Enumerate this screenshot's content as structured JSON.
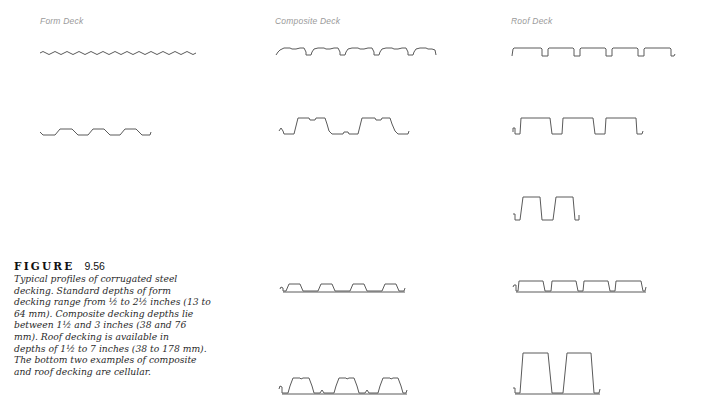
{
  "columns": [
    {
      "id": "form",
      "label": "Form Deck"
    },
    {
      "id": "composite",
      "label": "Composite Deck"
    },
    {
      "id": "roof",
      "label": "Roof Deck"
    }
  ],
  "figure": {
    "word": "FIGURE",
    "number": "9.56",
    "caption_lines": [
      "Typical profiles of corrugated steel",
      "decking. Standard depths of form",
      "decking range from ½ to 2½ inches (13 to",
      "64 mm). Composite decking depths lie",
      "between 1½ and 3 inches (38 and 76",
      "mm). Roof decking is available in",
      "depths of 1½ to 7 inches (38 to 178 mm).",
      "The bottom two examples of composite",
      "and roof decking are cellular."
    ]
  },
  "profiles": [
    {
      "column": "form",
      "name": "form-deck-corrugated-wave"
    },
    {
      "column": "form",
      "name": "form-deck-trapezoidal"
    },
    {
      "column": "composite",
      "name": "composite-deck-embossed-ribbed"
    },
    {
      "column": "composite",
      "name": "composite-deck-deep-rib"
    },
    {
      "column": "composite",
      "name": "composite-deck-cellular-shallow"
    },
    {
      "column": "composite",
      "name": "composite-deck-cellular-deep"
    },
    {
      "column": "roof",
      "name": "roof-deck-narrow-rib"
    },
    {
      "column": "roof",
      "name": "roof-deck-intermediate-rib"
    },
    {
      "column": "roof",
      "name": "roof-deck-deep-rib"
    },
    {
      "column": "roof",
      "name": "roof-deck-cellular-shallow"
    },
    {
      "column": "roof",
      "name": "roof-deck-cellular-deep"
    }
  ]
}
